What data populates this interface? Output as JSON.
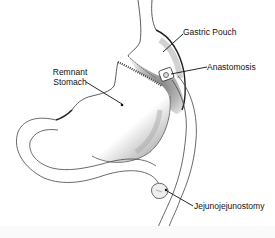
{
  "diagram": {
    "labels": {
      "gastric_pouch": "Gastric Pouch",
      "anastomosis": "Anastomosis",
      "remnant_stomach_line1": "Remnant",
      "remnant_stomach_line2": "Stomach",
      "jejunojejunostomy": "Jejunojejunostomy"
    },
    "colors": {
      "line": "#333333",
      "shade": "#8a8a8a",
      "label_text": "#111111",
      "background": "#ffffff"
    }
  }
}
